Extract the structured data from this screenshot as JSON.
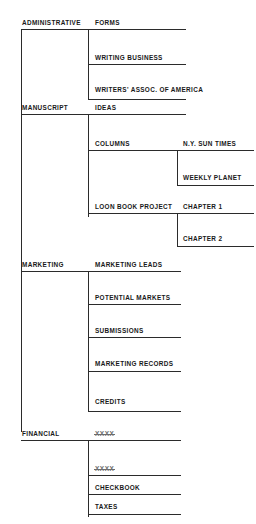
{
  "document": {
    "title": "Filing System Organization Chart",
    "type": "hand-drawn hierarchical file index",
    "ink_color": "#2b2b2b",
    "paper_color": "#ffffff"
  },
  "columns": {
    "level1_label": "Main Category",
    "level2_label": "Sub Category",
    "level3_label": "Detail"
  },
  "categories": [
    {
      "name": "ADMINISTRATIVE",
      "subitems": [
        {
          "name": "FORMS",
          "details": []
        },
        {
          "name": "WRITING BUSINESS",
          "details": []
        },
        {
          "name": "WRITERS' ASSOC. OF AMERICA",
          "details": []
        }
      ]
    },
    {
      "name": "MANUSCRIPT",
      "subitems": [
        {
          "name": "IDEAS",
          "details": []
        },
        {
          "name": "COLUMNS",
          "details": [
            "N.Y. SUN TIMES",
            "WEEKLY PLANET"
          ]
        },
        {
          "name": "LOON BOOK PROJECT",
          "details": [
            "CHAPTER 1",
            "CHAPTER 2"
          ]
        }
      ]
    },
    {
      "name": "MARKETING",
      "subitems": [
        {
          "name": "MARKETING LEADS",
          "details": []
        },
        {
          "name": "POTENTIAL MARKETS",
          "details": []
        },
        {
          "name": "SUBMISSIONS",
          "details": []
        },
        {
          "name": "MARKETING RECORDS",
          "details": []
        },
        {
          "name": "CREDITS",
          "details": []
        }
      ]
    },
    {
      "name": "FINANCIAL",
      "subitems": [
        {
          "name": "XXXX",
          "struck": true,
          "details": []
        },
        {
          "name": "XXXX",
          "struck": true,
          "details": []
        },
        {
          "name": "CHECKBOOK",
          "details": []
        },
        {
          "name": "TAXES",
          "details": []
        }
      ]
    }
  ],
  "labels": {
    "administrative": "ADMINISTRATIVE",
    "forms": "FORMS",
    "writing_business": "WRITING BUSINESS",
    "writers_assoc": "WRITERS' ASSOC. OF AMERICA",
    "manuscript": "MANUSCRIPT",
    "ideas": "IDEAS",
    "columns": "COLUMNS",
    "ny_sun_times": "N.Y. SUN TIMES",
    "weekly_planet": "WEEKLY PLANET",
    "loon_book_project": "LOON BOOK PROJECT",
    "chapter_1": "CHAPTER 1",
    "chapter_2": "CHAPTER 2",
    "marketing": "MARKETING",
    "marketing_leads": "MARKETING LEADS",
    "potential_markets": "POTENTIAL MARKETS",
    "submissions": "SUBMISSIONS",
    "marketing_records": "MARKETING RECORDS",
    "credits": "CREDITS",
    "financial": "FINANCIAL",
    "struck_1": "XXXX",
    "struck_2": "XXXX",
    "checkbook": "CHECKBOOK",
    "taxes": "TAXES"
  }
}
